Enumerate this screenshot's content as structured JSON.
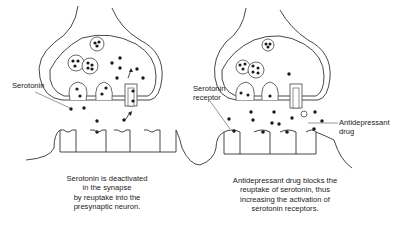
{
  "left_panel": {
    "label_serotonin": "Serotonin",
    "caption": [
      "Serotonin is deactivated",
      "in the synapse",
      "by reuptake into the",
      "presynaptic neuron."
    ]
  },
  "right_panel": {
    "label_receptor": [
      "Serotonin",
      "receptor"
    ],
    "label_drug": [
      "Antidepressant",
      "drug"
    ],
    "caption": [
      "Antidepressant drug blocks the",
      "reuptake of serotonin, thus",
      "increasing the activation of",
      "serotonin receptors."
    ]
  }
}
